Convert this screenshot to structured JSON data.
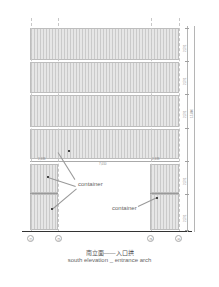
{
  "drawing": {
    "title_cn": "南立面——入口拱",
    "title_en": "south elevation _ entrance arch",
    "labels": {
      "container_left": "container",
      "container_right": "container"
    },
    "axes": [
      "①",
      "②",
      "③",
      "④"
    ],
    "horizontal_dims": {
      "left_pier": "2,438",
      "span": "7,010",
      "right_pier": "2,438"
    },
    "vertical_dims": {
      "tier1": "2,591",
      "tier2": "2,591",
      "tier3": "2,591",
      "tier4": "2,591",
      "tier5": "2,591",
      "total": "15,840"
    },
    "colors": {
      "panel_fill": "#e6e6e6",
      "line": "#bdbdbd",
      "ground": "#333333"
    }
  }
}
